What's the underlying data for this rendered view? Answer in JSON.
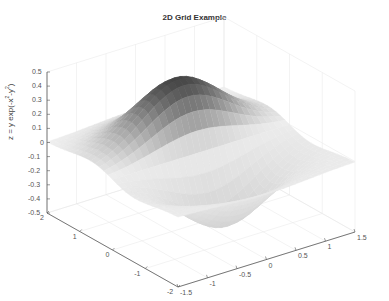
{
  "chart_data": {
    "type": "surface",
    "title": "2D Grid Example",
    "function": "z = y exp(-x^2-y^2)",
    "xlabel": "",
    "ylabel": "",
    "zlabel": "z = y exp(-x^2-y^2)",
    "x_range": [
      -1.5,
      1.5
    ],
    "y_range": [
      -2,
      2
    ],
    "z_range": [
      -0.5,
      0.5
    ],
    "x_ticks": [
      "-1.5",
      "-1",
      "-0.5",
      "0",
      "0.5",
      "1",
      "1.5"
    ],
    "y_ticks": [
      "2",
      "1",
      "0",
      "-1",
      "-2"
    ],
    "z_ticks": [
      "0.5",
      "0.4",
      "0.3",
      "0.2",
      "0.1",
      "0",
      "-0.1",
      "-0.2",
      "-0.3",
      "-0.4",
      "-0.5"
    ],
    "peak": {
      "x": 0,
      "y": 0.71,
      "z": 0.43
    },
    "trough": {
      "x": 0,
      "y": -0.71,
      "z": -0.43
    },
    "colormap": "gray",
    "grid": true,
    "legend": null
  },
  "labels": {
    "title": "2D Grid Example",
    "zlabel_text": "z = y exp(-x",
    "zlabel_sup1": "2",
    "zlabel_mid": "-y",
    "zlabel_sup2": "2",
    "zlabel_end": ")"
  }
}
